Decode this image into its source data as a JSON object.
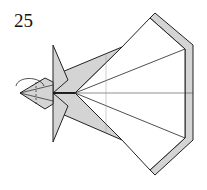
{
  "diagram": {
    "step_number": "25",
    "colors": {
      "paper_back": "#d4d4d4",
      "paper_front": "#ffffff",
      "line": "#222222"
    }
  }
}
